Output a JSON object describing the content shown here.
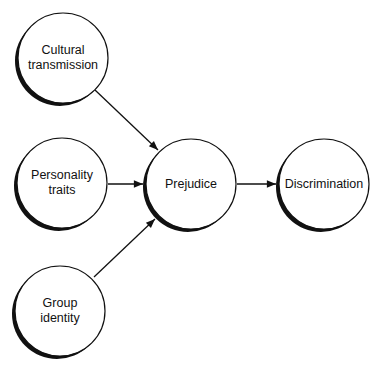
{
  "diagram": {
    "nodes": [
      {
        "id": "cultural",
        "lines": [
          "Cultural",
          "transmission"
        ]
      },
      {
        "id": "personality",
        "lines": [
          "Personality",
          "traits"
        ]
      },
      {
        "id": "group",
        "lines": [
          "Group",
          "identity"
        ]
      },
      {
        "id": "prejudice",
        "lines": [
          "Prejudice"
        ]
      },
      {
        "id": "discrimination",
        "lines": [
          "Discrimination"
        ]
      }
    ],
    "edges": [
      {
        "from": "cultural",
        "to": "prejudice"
      },
      {
        "from": "personality",
        "to": "prejudice"
      },
      {
        "from": "group",
        "to": "prejudice"
      },
      {
        "from": "prejudice",
        "to": "discrimination"
      }
    ],
    "colors": {
      "stroke": "#111111",
      "fill": "#ffffff"
    }
  }
}
